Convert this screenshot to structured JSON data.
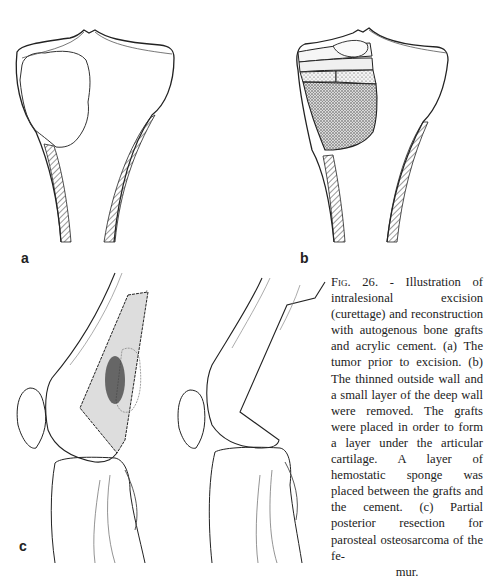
{
  "figure": {
    "panels": [
      {
        "id": "a",
        "label": "a",
        "content": "tibia-with-tumor"
      },
      {
        "id": "b",
        "label": "b",
        "content": "tibia-with-grafts-and-cement"
      },
      {
        "id": "c",
        "label": "c",
        "content": "knee-lateral-partial-posterior-resection"
      }
    ],
    "caption": {
      "fig_label": "Fig. 26.",
      "separator": " - ",
      "body": "Illustration of intralesional excision (curettage) and reconstruction with autogenous bone grafts and acrylic cement. (a) The tumor prior to excision. (b) The thinned outside wall and a small layer of the deep wall were removed. The grafts were placed in order to form a layer under the articular cartilage. A layer of hemostatic sponge was placed between the grafts and the cement. (c) Partial posterior resection for parosteal osteosarcoma of the fe-",
      "last_line": "mur."
    }
  }
}
